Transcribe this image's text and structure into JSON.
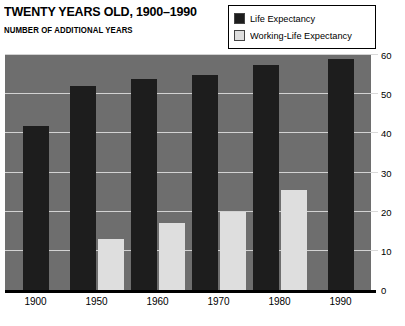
{
  "header": {
    "title": "TWENTY YEARS OLD, 1900–1990",
    "subtitle": "NUMBER OF ADDITIONAL YEARS"
  },
  "legend": {
    "position": "top-right",
    "entries": [
      {
        "label": "Life Expectancy",
        "color": "#1d1d1d",
        "key": "life"
      },
      {
        "label": "Working-Life Expectancy",
        "color": "#dedede",
        "key": "working"
      }
    ]
  },
  "colors": {
    "plot_background": "#6e6e6e",
    "gridline": "#d2d2d2",
    "life_expectancy": "#1d1d1d",
    "working_life_expectancy": "#dedede",
    "axis": "#000000",
    "page_background": "#ffffff"
  },
  "axes": {
    "y": {
      "ticks": [
        "0",
        "10",
        "20",
        "30",
        "40",
        "50",
        "60"
      ],
      "values": [
        0,
        10,
        20,
        30,
        40,
        50,
        60
      ],
      "min": 0,
      "max": 60,
      "position": "right"
    },
    "x": {
      "ticks": [
        "1900",
        "1950",
        "1960",
        "1970",
        "1980",
        "1990"
      ]
    }
  },
  "chart_data": {
    "type": "bar",
    "title": "TWENTY YEARS OLD, 1900–1990",
    "subtitle": "NUMBER OF ADDITIONAL YEARS",
    "xlabel": "",
    "ylabel": "NUMBER OF ADDITIONAL YEARS",
    "ylim": [
      0,
      60
    ],
    "yticks": [
      0,
      10,
      20,
      30,
      40,
      50,
      60
    ],
    "grid": true,
    "legend_position": "top-right",
    "categories": [
      "1900",
      "1950",
      "1960",
      "1970",
      "1980",
      "1990"
    ],
    "series": [
      {
        "name": "Life Expectancy",
        "color": "#1d1d1d",
        "values": [
          42,
          52,
          54,
          55,
          57.5,
          59
        ]
      },
      {
        "name": "Working-Life Expectancy",
        "color": "#dedede",
        "values": [
          null,
          13,
          17,
          20,
          25.5,
          null
        ]
      }
    ]
  }
}
